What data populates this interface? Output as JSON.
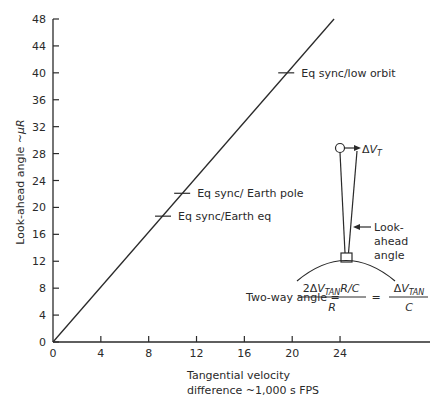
{
  "chart_data": {
    "type": "line",
    "title": "",
    "xlabel": "Tangential velocity difference ~1,000 s FPS",
    "xlabel_lines": [
      "Tangential velocity",
      "difference ~1,000 s FPS"
    ],
    "ylabel": "Look-ahead angle ~μR",
    "ylabel_prefix": "Look-ahead angle ~",
    "ylabel_mu": "μ",
    "ylabel_R": "R",
    "xlim": [
      0,
      32
    ],
    "ylim": [
      0,
      48
    ],
    "x_ticks": [
      0,
      4,
      8,
      12,
      16,
      20,
      24
    ],
    "x_tick_labels": [
      "0",
      "4",
      "8",
      "12",
      "16",
      "20",
      "24"
    ],
    "y_ticks": [
      0,
      4,
      8,
      12,
      16,
      20,
      24,
      28,
      32,
      36,
      40,
      44,
      48
    ],
    "y_tick_labels": [
      "0",
      "4",
      "8",
      "12",
      "16",
      "20",
      "24",
      "28",
      "32",
      "36",
      "40",
      "44",
      "48"
    ],
    "grid": false,
    "legend": "none",
    "series": [
      {
        "name": "Look-ahead angle",
        "x": [
          0,
          23.5
        ],
        "y": [
          0,
          48
        ]
      }
    ],
    "annotations": [
      {
        "label": "Eq sync/low orbit",
        "x": 19.5,
        "y": 40
      },
      {
        "label": "Eq sync/ Earth pole",
        "x": 10.8,
        "y": 22.1
      },
      {
        "label": "Eq sync/Earth eq",
        "x": 9.2,
        "y": 18.7
      }
    ]
  },
  "inset_diagram": {
    "delta_symbol": "Δ",
    "velocity_label_V": "V",
    "velocity_label_sub": "T",
    "lookahead_lines": [
      "Look-",
      "ahead",
      "angle"
    ]
  },
  "formula": {
    "lhs": "Two-way angle =",
    "num1_prefix": "2Δ",
    "num1_V": "V",
    "num1_sub": "TAN",
    "num1_suffix": "R/C",
    "den1": "R",
    "equals": "=",
    "num2_prefix": "Δ",
    "num2_V": "V",
    "num2_sub": "TAN",
    "den2": "C"
  }
}
